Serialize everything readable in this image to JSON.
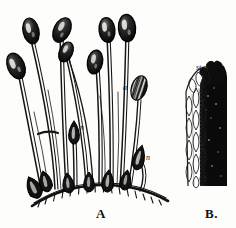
{
  "plate": {
    "title": "Moss sporophyte engraving plate",
    "background_color": "#fdfdfb",
    "ink_color": "#111111",
    "figures": [
      {
        "id": "A",
        "caption": "A",
        "description": "Tuft of moss sporophytes: many slender setae rising from a curved cushion, each bearing a dark ovoid capsule; young buds and an operculate capsule are labelled.",
        "labels": [
          {
            "text": "a",
            "name": "label-a",
            "x": 123,
            "y": 90,
            "refers_to": "ribbed capsule"
          },
          {
            "text": "n",
            "name": "label-n1",
            "x": 80,
            "y": 130,
            "refers_to": "young bud"
          },
          {
            "text": "n",
            "name": "label-n2",
            "x": 146,
            "y": 160,
            "refers_to": "young bud"
          }
        ]
      },
      {
        "id": "B",
        "caption": "B.",
        "description": "Magnified longitudinal detail: rows of elongate hyaline cells at left against a dense dark mass at right.",
        "labels": [
          {
            "text": "st.",
            "name": "label-st",
            "x": 196,
            "y": 70,
            "refers_to": "stoma / stem detail"
          }
        ]
      }
    ]
  }
}
